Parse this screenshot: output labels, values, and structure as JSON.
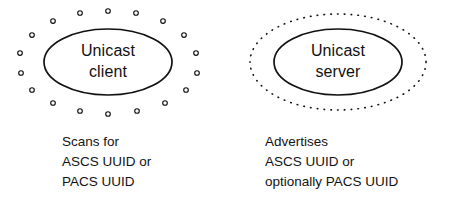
{
  "diagram": {
    "background_color": "#ffffff",
    "stroke_color": "#111111",
    "nodes": [
      {
        "id": "client",
        "label_lines": [
          "Unicast",
          "client"
        ],
        "shape": "ellipse",
        "halo": "sparse-open-circles",
        "caption_lines": [
          "Scans for",
          "ASCS UUID or",
          "PACS UUID"
        ]
      },
      {
        "id": "server",
        "label_lines": [
          "Unicast",
          "server"
        ],
        "shape": "ellipse",
        "halo": "dotted-ellipse",
        "caption_lines": [
          "Advertises",
          "ASCS UUID or",
          "optionally PACS UUID"
        ]
      }
    ]
  }
}
